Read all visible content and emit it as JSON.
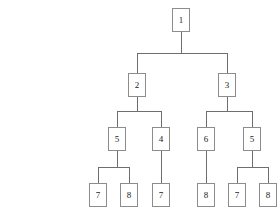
{
  "diagram": {
    "type": "tree",
    "background_color": "#ffffff",
    "node_border_color": "#8c8c8c",
    "node_fill_color": "#ffffff",
    "edge_color": "#6e6e6e",
    "node_width": 18,
    "node_height": 24,
    "nodes": [
      {
        "id": "n1",
        "label": "1",
        "x": 172,
        "y": 8,
        "level": 0
      },
      {
        "id": "n2",
        "label": "2",
        "x": 128,
        "y": 73,
        "level": 1
      },
      {
        "id": "n3",
        "label": "3",
        "x": 218,
        "y": 73,
        "level": 1
      },
      {
        "id": "n4",
        "label": "5",
        "x": 108,
        "y": 127,
        "level": 2
      },
      {
        "id": "n5",
        "label": "4",
        "x": 152,
        "y": 127,
        "level": 2
      },
      {
        "id": "n6",
        "label": "6",
        "x": 197,
        "y": 127,
        "level": 2
      },
      {
        "id": "n7",
        "label": "5",
        "x": 243,
        "y": 127,
        "level": 2
      },
      {
        "id": "n8",
        "label": "7",
        "x": 89,
        "y": 183,
        "level": 3
      },
      {
        "id": "n9",
        "label": "8",
        "x": 120,
        "y": 183,
        "level": 3
      },
      {
        "id": "n10",
        "label": "7",
        "x": 152,
        "y": 183,
        "level": 3
      },
      {
        "id": "n11",
        "label": "8",
        "x": 197,
        "y": 183,
        "level": 3
      },
      {
        "id": "n12",
        "label": "7",
        "x": 228,
        "y": 183,
        "level": 3
      },
      {
        "id": "n13",
        "label": "8",
        "x": 259,
        "y": 183,
        "level": 3
      }
    ],
    "edges": [
      {
        "from": "n1",
        "to": "n2",
        "bus_y": 53
      },
      {
        "from": "n1",
        "to": "n3",
        "bus_y": 53
      },
      {
        "from": "n2",
        "to": "n4",
        "bus_y": 111
      },
      {
        "from": "n2",
        "to": "n5",
        "bus_y": 111
      },
      {
        "from": "n3",
        "to": "n6",
        "bus_y": 111
      },
      {
        "from": "n3",
        "to": "n7",
        "bus_y": 111
      },
      {
        "from": "n4",
        "to": "n8",
        "bus_y": 167
      },
      {
        "from": "n4",
        "to": "n9",
        "bus_y": 167
      },
      {
        "from": "n5",
        "to": "n10",
        "bus_y": 167
      },
      {
        "from": "n6",
        "to": "n11",
        "bus_y": 167
      },
      {
        "from": "n7",
        "to": "n12",
        "bus_y": 167
      },
      {
        "from": "n7",
        "to": "n13",
        "bus_y": 167
      }
    ]
  }
}
